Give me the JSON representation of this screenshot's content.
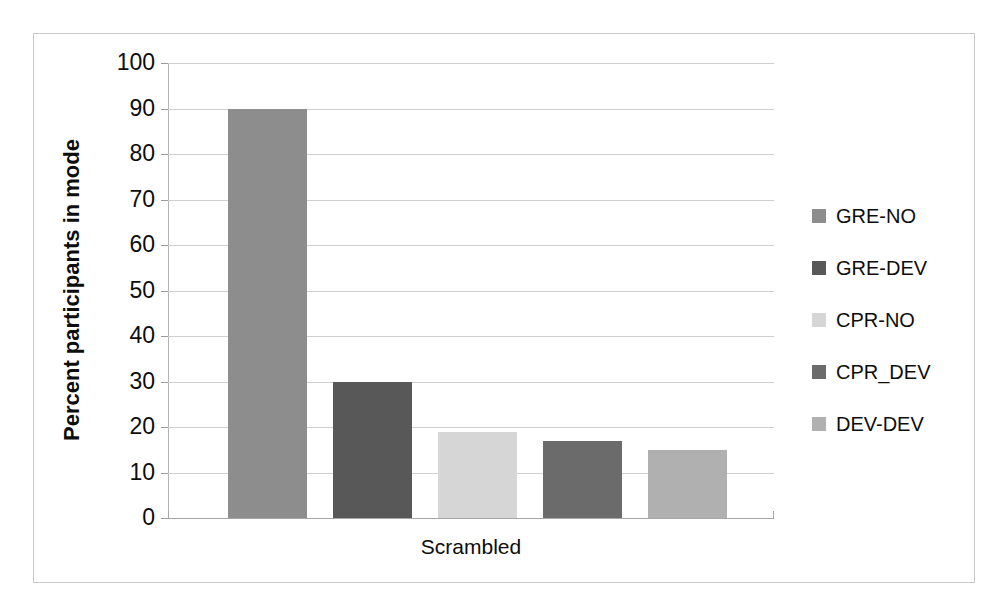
{
  "chart_data": {
    "type": "bar",
    "title": "",
    "xlabel": "Scrambled",
    "ylabel": "Percent participants in mode",
    "categories": [
      "Scrambled"
    ],
    "ylim": [
      0,
      100
    ],
    "ytick_labels": [
      "100",
      "90",
      "80",
      "70",
      "60",
      "50",
      "40",
      "30",
      "20",
      "10",
      "0"
    ],
    "ytick_values": [
      100,
      90,
      80,
      70,
      60,
      50,
      40,
      30,
      20,
      10,
      0
    ],
    "grid": true,
    "legend_position": "right",
    "series": [
      {
        "name": "GRE-NO",
        "values": [
          90
        ],
        "color": "#8d8d8d"
      },
      {
        "name": "GRE-DEV",
        "values": [
          30
        ],
        "color": "#585858"
      },
      {
        "name": "CPR-NO",
        "values": [
          19
        ],
        "color": "#d6d6d6"
      },
      {
        "name": "CPR_DEV",
        "values": [
          17
        ],
        "color": "#6b6b6b"
      },
      {
        "name": "DEV-DEV",
        "values": [
          15
        ],
        "color": "#b0b0b0"
      }
    ]
  },
  "axis": {
    "y_title": "Percent participants in mode",
    "x_category_label": "Scrambled"
  },
  "legend": {
    "items": [
      {
        "label": "GRE-NO",
        "color": "#8d8d8d"
      },
      {
        "label": "GRE-DEV",
        "color": "#585858"
      },
      {
        "label": "CPR-NO",
        "color": "#d6d6d6"
      },
      {
        "label": "CPR_DEV",
        "color": "#6b6b6b"
      },
      {
        "label": "DEV-DEV",
        "color": "#b0b0b0"
      }
    ]
  },
  "colors": {
    "frame_border": "#c9c9c9",
    "gridline": "#cfcfcf",
    "axis_line": "#a6a6a6",
    "text": "#0d0d0d",
    "background": "#ffffff"
  }
}
